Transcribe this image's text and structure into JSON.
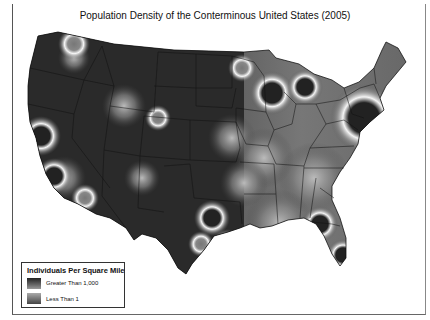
{
  "map": {
    "title": "Population Density of the Conterminous United States (2005)",
    "region": "Conterminous United States",
    "year": "2005",
    "colors": {
      "background": "#ffffff",
      "low_density": "#2a2a2a",
      "high_density_ring": "#f2f2f2",
      "state_borders": "#111111"
    },
    "legend": {
      "title": "Individuals Per Square Mile",
      "items": [
        {
          "label": "Greater Than 1,000",
          "swatch": "dark-to-light gradient"
        },
        {
          "label": "Less Than 1",
          "swatch": "light-to-dark gradient"
        }
      ]
    }
  }
}
